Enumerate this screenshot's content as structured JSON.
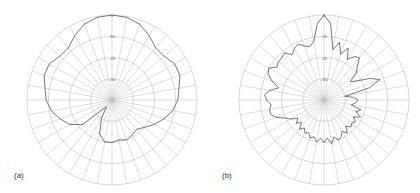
{
  "figure": {
    "panels": [
      {
        "id": "a",
        "label": "(a)",
        "cx": 112,
        "cy": 100,
        "r": 85,
        "label_x": 14,
        "label_y": 176
      },
      {
        "id": "b",
        "label": "(b)",
        "cx": 324,
        "cy": 100,
        "r": 85,
        "label_x": 222,
        "label_y": 176
      }
    ],
    "grid_color": "#bdbdbd",
    "trace_color": "#555555"
  },
  "chart_data": [
    {
      "type": "line",
      "subtype": "polar",
      "title": "(a)",
      "radial_ticks": [
        "0",
        "-10",
        "-20",
        "-30"
      ],
      "radial_range_db": [
        -40,
        0
      ],
      "angular_grid_step_deg": 10,
      "grid": true,
      "series": [
        {
          "name": "pattern-a",
          "angles_deg": [
            0,
            10,
            20,
            30,
            40,
            50,
            60,
            70,
            80,
            90,
            100,
            110,
            120,
            130,
            140,
            150,
            160,
            170,
            180,
            190,
            200,
            210,
            220,
            230,
            240,
            250,
            260,
            270,
            280,
            290,
            300,
            310,
            320,
            330,
            340,
            350
          ],
          "values_db": [
            0,
            -0.5,
            -2,
            -5,
            -8,
            -8,
            -6,
            -6,
            -8,
            -9,
            -11,
            -14,
            -17,
            -20,
            -22,
            -21,
            -20,
            -21,
            -20,
            -20,
            -23,
            -30,
            -36,
            -22,
            -17,
            -14,
            -11,
            -9,
            -8,
            -6,
            -6,
            -8,
            -8,
            -5,
            -2,
            -0.5
          ]
        }
      ]
    },
    {
      "type": "line",
      "subtype": "polar",
      "title": "(b)",
      "radial_ticks": [
        "0",
        "-10",
        "-20",
        "-30"
      ],
      "radial_range_db": [
        -40,
        0
      ],
      "angular_grid_step_deg": 10,
      "grid": true,
      "series": [
        {
          "name": "pattern-b",
          "angles_deg": [
            0,
            5,
            10,
            15,
            20,
            25,
            30,
            35,
            40,
            45,
            50,
            55,
            60,
            65,
            70,
            75,
            80,
            85,
            90,
            95,
            100,
            105,
            110,
            115,
            120,
            125,
            130,
            135,
            140,
            145,
            150,
            155,
            160,
            165,
            170,
            175,
            180,
            185,
            190,
            195,
            200,
            205,
            210,
            215,
            220,
            225,
            230,
            235,
            240,
            245,
            250,
            255,
            260,
            265,
            270,
            275,
            280,
            285,
            290,
            295,
            300,
            305,
            310,
            315,
            320,
            325,
            330,
            335,
            340,
            345,
            350,
            355
          ],
          "values_db": [
            0,
            -4,
            -16,
            -12,
            -17,
            -13,
            -18,
            -15,
            -14,
            -18,
            -20,
            -25,
            -22,
            -16,
            -12,
            -18,
            -30,
            -26,
            -24,
            -25,
            -27,
            -22,
            -24,
            -21,
            -24,
            -22,
            -23,
            -22,
            -24,
            -21,
            -23,
            -21,
            -20,
            -22,
            -19,
            -22,
            -20,
            -22,
            -20,
            -22,
            -21,
            -23,
            -22,
            -24,
            -22,
            -25,
            -23,
            -25,
            -22,
            -20,
            -16,
            -14,
            -14,
            -15,
            -13,
            -12,
            -14,
            -18,
            -14,
            -11,
            -10,
            -13,
            -12,
            -12,
            -11,
            -14,
            -12,
            -11,
            -13,
            -14,
            -12,
            -4
          ]
        }
      ]
    }
  ]
}
